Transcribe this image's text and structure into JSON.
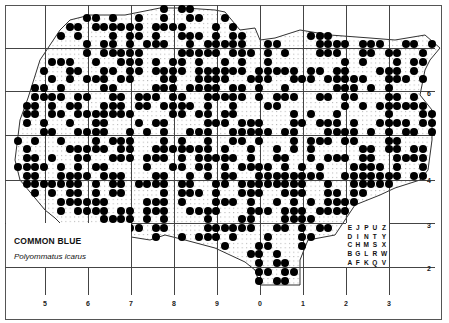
{
  "map": {
    "species_common_name": "COMMON BLUE",
    "species_scientific_name": "Polyommatus icarus",
    "bottom_axis_labels": [
      "5",
      "6",
      "7",
      "8",
      "9",
      "0",
      "1",
      "2",
      "3"
    ],
    "right_axis_labels": [
      {
        "label": "6",
        "y": 95
      },
      {
        "label": "4",
        "y": 182
      },
      {
        "label": "3",
        "y": 227
      },
      {
        "label": "2",
        "y": 270
      }
    ],
    "tetrad_key": [
      [
        "E",
        "J",
        "P",
        "U",
        "Z"
      ],
      [
        "D",
        "I",
        "N",
        "T",
        "Y"
      ],
      [
        "C",
        "H",
        "M",
        "S",
        "X"
      ],
      [
        "B",
        "G",
        "L",
        "R",
        "W"
      ],
      [
        "A",
        "F",
        "K",
        "Q",
        "V"
      ]
    ],
    "dot_color": "#000000",
    "grid_color": "#444444",
    "dot_rows": [
      "000000000000000000000000000000000000000000000000000",
      "000000000000000000011110000001100000000000000000000",
      "000000000000000000000000000000000000000000000000000",
      "000000000000000000000000000000000000000000000000000",
      "000000000000000000000000000000000000000000000000000"
    ]
  }
}
